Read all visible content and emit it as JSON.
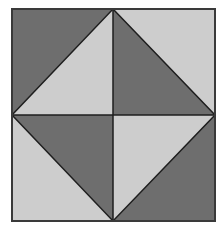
{
  "diagram": {
    "type": "quilt-block-pattern",
    "colors": {
      "dark": "#6e6e6e",
      "light": "#cdcdcd",
      "line": "#1e1e1e",
      "background": "#ffffff"
    },
    "square": {
      "x": 12,
      "y": 9,
      "width": 203,
      "height": 212
    },
    "quadrants": [
      {
        "position": "top-left",
        "dark": "upper-left triangle",
        "light": "lower-right triangle"
      },
      {
        "position": "top-right",
        "dark": "lower-left triangle",
        "light": "upper-right triangle"
      },
      {
        "position": "bottom-left",
        "dark": "upper-right triangle",
        "light": "lower-left triangle"
      },
      {
        "position": "bottom-right",
        "dark": "lower-right triangle",
        "light": "upper-left triangle"
      }
    ]
  }
}
